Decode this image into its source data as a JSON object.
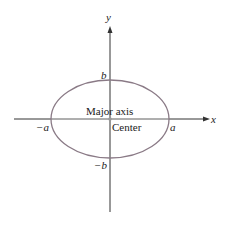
{
  "diagram": {
    "type": "ellipse-axes",
    "axes": {
      "x_label": "x",
      "y_label": "y"
    },
    "vertices": {
      "right": "a",
      "left": "−a",
      "top": "b",
      "bottom": "−b"
    },
    "annotations": {
      "major_axis": "Major axis",
      "center": "Center"
    },
    "colors": {
      "ellipse": "#8a7a86",
      "axis": "#333333",
      "major_axis_line": "#b8b8b8"
    }
  }
}
